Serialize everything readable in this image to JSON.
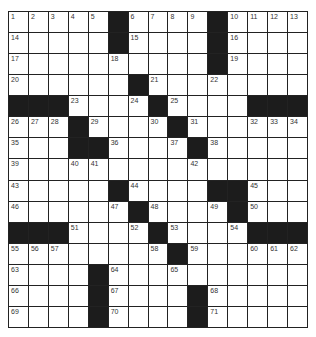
{
  "puzzle": {
    "rows": 15,
    "cols": 15,
    "colors": {
      "block": "#1c1c1c",
      "cell": "#ffffff",
      "line": "#222222"
    },
    "blocks": [
      [
        0,
        5
      ],
      [
        0,
        10
      ],
      [
        1,
        5
      ],
      [
        1,
        10
      ],
      [
        2,
        10
      ],
      [
        3,
        6
      ],
      [
        4,
        0
      ],
      [
        4,
        1
      ],
      [
        4,
        2
      ],
      [
        4,
        7
      ],
      [
        4,
        12
      ],
      [
        4,
        13
      ],
      [
        4,
        14
      ],
      [
        5,
        3
      ],
      [
        5,
        8
      ],
      [
        6,
        3
      ],
      [
        6,
        4
      ],
      [
        6,
        9
      ],
      [
        8,
        5
      ],
      [
        8,
        10
      ],
      [
        8,
        11
      ],
      [
        9,
        6
      ],
      [
        9,
        11
      ],
      [
        10,
        0
      ],
      [
        10,
        1
      ],
      [
        10,
        2
      ],
      [
        10,
        7
      ],
      [
        10,
        12
      ],
      [
        10,
        13
      ],
      [
        10,
        14
      ],
      [
        11,
        8
      ],
      [
        12,
        4
      ],
      [
        13,
        4
      ],
      [
        13,
        9
      ],
      [
        14,
        4
      ],
      [
        14,
        9
      ]
    ],
    "numbers": [
      {
        "r": 0,
        "c": 0,
        "n": "1"
      },
      {
        "r": 0,
        "c": 1,
        "n": "2"
      },
      {
        "r": 0,
        "c": 2,
        "n": "3"
      },
      {
        "r": 0,
        "c": 3,
        "n": "4"
      },
      {
        "r": 0,
        "c": 4,
        "n": "5"
      },
      {
        "r": 0,
        "c": 6,
        "n": "6"
      },
      {
        "r": 0,
        "c": 7,
        "n": "7"
      },
      {
        "r": 0,
        "c": 8,
        "n": "8"
      },
      {
        "r": 0,
        "c": 9,
        "n": "9"
      },
      {
        "r": 0,
        "c": 11,
        "n": "10"
      },
      {
        "r": 0,
        "c": 12,
        "n": "11"
      },
      {
        "r": 0,
        "c": 13,
        "n": "12"
      },
      {
        "r": 0,
        "c": 14,
        "n": "13"
      },
      {
        "r": 1,
        "c": 0,
        "n": "14"
      },
      {
        "r": 1,
        "c": 6,
        "n": "15"
      },
      {
        "r": 1,
        "c": 11,
        "n": "16"
      },
      {
        "r": 2,
        "c": 0,
        "n": "17"
      },
      {
        "r": 2,
        "c": 5,
        "n": "18"
      },
      {
        "r": 2,
        "c": 11,
        "n": "19"
      },
      {
        "r": 3,
        "c": 0,
        "n": "20"
      },
      {
        "r": 3,
        "c": 7,
        "n": "21"
      },
      {
        "r": 3,
        "c": 10,
        "n": "22"
      },
      {
        "r": 4,
        "c": 3,
        "n": "23"
      },
      {
        "r": 4,
        "c": 6,
        "n": "24"
      },
      {
        "r": 4,
        "c": 8,
        "n": "25"
      },
      {
        "r": 5,
        "c": 0,
        "n": "26"
      },
      {
        "r": 5,
        "c": 1,
        "n": "27"
      },
      {
        "r": 5,
        "c": 2,
        "n": "28"
      },
      {
        "r": 5,
        "c": 4,
        "n": "29"
      },
      {
        "r": 5,
        "c": 7,
        "n": "30"
      },
      {
        "r": 5,
        "c": 9,
        "n": "31"
      },
      {
        "r": 5,
        "c": 12,
        "n": "32"
      },
      {
        "r": 5,
        "c": 13,
        "n": "33"
      },
      {
        "r": 5,
        "c": 14,
        "n": "34"
      },
      {
        "r": 6,
        "c": 0,
        "n": "35"
      },
      {
        "r": 6,
        "c": 5,
        "n": "36"
      },
      {
        "r": 6,
        "c": 8,
        "n": "37"
      },
      {
        "r": 6,
        "c": 10,
        "n": "38"
      },
      {
        "r": 7,
        "c": 0,
        "n": "39"
      },
      {
        "r": 7,
        "c": 3,
        "n": "40"
      },
      {
        "r": 7,
        "c": 4,
        "n": "41"
      },
      {
        "r": 7,
        "c": 9,
        "n": "42"
      },
      {
        "r": 8,
        "c": 0,
        "n": "43"
      },
      {
        "r": 8,
        "c": 6,
        "n": "44"
      },
      {
        "r": 8,
        "c": 12,
        "n": "45"
      },
      {
        "r": 9,
        "c": 0,
        "n": "46"
      },
      {
        "r": 9,
        "c": 5,
        "n": "47"
      },
      {
        "r": 9,
        "c": 7,
        "n": "48"
      },
      {
        "r": 9,
        "c": 10,
        "n": "49"
      },
      {
        "r": 9,
        "c": 12,
        "n": "50"
      },
      {
        "r": 10,
        "c": 3,
        "n": "51"
      },
      {
        "r": 10,
        "c": 6,
        "n": "52"
      },
      {
        "r": 10,
        "c": 8,
        "n": "53"
      },
      {
        "r": 10,
        "c": 11,
        "n": "54"
      },
      {
        "r": 11,
        "c": 0,
        "n": "55"
      },
      {
        "r": 11,
        "c": 1,
        "n": "56"
      },
      {
        "r": 11,
        "c": 2,
        "n": "57"
      },
      {
        "r": 11,
        "c": 7,
        "n": "58"
      },
      {
        "r": 11,
        "c": 9,
        "n": "59"
      },
      {
        "r": 11,
        "c": 12,
        "n": "60"
      },
      {
        "r": 11,
        "c": 13,
        "n": "61"
      },
      {
        "r": 11,
        "c": 14,
        "n": "62"
      },
      {
        "r": 12,
        "c": 0,
        "n": "63"
      },
      {
        "r": 12,
        "c": 5,
        "n": "64"
      },
      {
        "r": 12,
        "c": 8,
        "n": "65"
      },
      {
        "r": 13,
        "c": 0,
        "n": "66"
      },
      {
        "r": 13,
        "c": 5,
        "n": "67"
      },
      {
        "r": 13,
        "c": 10,
        "n": "68"
      },
      {
        "r": 14,
        "c": 0,
        "n": "69"
      },
      {
        "r": 14,
        "c": 5,
        "n": "70"
      },
      {
        "r": 14,
        "c": 10,
        "n": "71"
      }
    ]
  }
}
